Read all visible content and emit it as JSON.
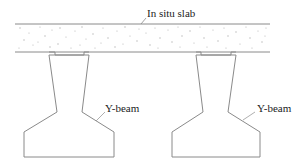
{
  "diagram": {
    "type": "structural-cross-section",
    "labels": {
      "slab": "In situ slab",
      "beam_left": "Y-beam",
      "beam_right": "Y-beam"
    },
    "colors": {
      "line": "#8a8a8a",
      "text": "#222222",
      "aggregate_dots": "#b5b5b5",
      "background": "#ffffff"
    }
  }
}
